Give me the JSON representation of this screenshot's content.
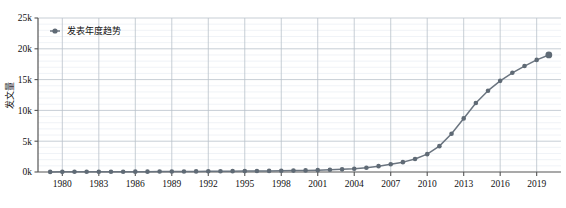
{
  "chart_data": {
    "type": "line",
    "title": "",
    "xlabel": "",
    "ylabel": "发文量",
    "legend": [
      {
        "name": "发表年度趋势",
        "color": "#6b7580",
        "marker": "circle"
      }
    ],
    "legend_position": "top-left-inside",
    "grid": true,
    "xlim": [
      1978,
      2021
    ],
    "ylim": [
      0,
      25000
    ],
    "ytick_labels": [
      "0k",
      "5k",
      "10k",
      "15k",
      "20k",
      "25k"
    ],
    "ytick_values": [
      0,
      5000,
      10000,
      15000,
      20000,
      25000
    ],
    "y_minor_step": 1000,
    "xtick_labels": [
      "1980",
      "1983",
      "1986",
      "1989",
      "1992",
      "1995",
      "1998",
      "2001",
      "2004",
      "2007",
      "2010",
      "2013",
      "2016",
      "2019"
    ],
    "xtick_values": [
      1980,
      1983,
      1986,
      1989,
      1992,
      1995,
      1998,
      2001,
      2004,
      2007,
      2010,
      2013,
      2016,
      2019
    ],
    "x": [
      1979,
      1980,
      1981,
      1982,
      1983,
      1984,
      1985,
      1986,
      1987,
      1988,
      1989,
      1990,
      1991,
      1992,
      1993,
      1994,
      1995,
      1996,
      1997,
      1998,
      1999,
      2000,
      2001,
      2002,
      2003,
      2004,
      2005,
      2006,
      2007,
      2008,
      2009,
      2010,
      2011,
      2012,
      2013,
      2014,
      2015,
      2016,
      2017,
      2018,
      2019,
      2020
    ],
    "values": [
      20,
      25,
      30,
      35,
      40,
      45,
      50,
      55,
      60,
      70,
      80,
      90,
      100,
      110,
      120,
      135,
      150,
      165,
      180,
      200,
      230,
      260,
      300,
      360,
      430,
      520,
      700,
      950,
      1250,
      1600,
      2100,
      2900,
      4200,
      6200,
      8700,
      11200,
      13200,
      14800,
      16100,
      17200,
      18200,
      19000
    ],
    "highlight_last_point": true,
    "highlight_value": 19000,
    "line_color": "#6b7580",
    "marker_color": "#5f6a75"
  }
}
